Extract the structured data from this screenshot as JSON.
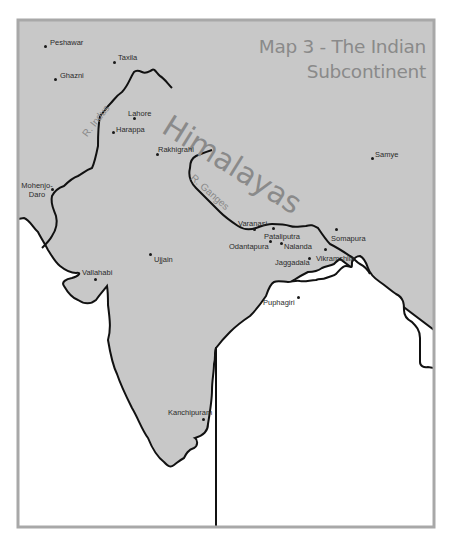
{
  "map": {
    "title_line1": "Map 3 - The Indian",
    "title_line2": "Subcontinent",
    "colors": {
      "land": "#c8c8c8",
      "sea": "#ffffff",
      "frame": "#a8a8a8",
      "coast": "#111111",
      "label": "#8a8a8a"
    },
    "mountain_range": {
      "label": "Himalayas"
    },
    "rivers": [
      {
        "label": "R. Indus"
      },
      {
        "label": "R. Ganges"
      }
    ],
    "cities": [
      {
        "name": "Peshawar",
        "x": 46,
        "y": 46
      },
      {
        "name": "Taxila",
        "x": 114,
        "y": 62
      },
      {
        "name": "Ghazni",
        "x": 55,
        "y": 79
      },
      {
        "name": "Lahore",
        "x": 134,
        "y": 118
      },
      {
        "name": "Harappa",
        "x": 113,
        "y": 132
      },
      {
        "name": "Rakhigrahi",
        "x": 157,
        "y": 154
      },
      {
        "name": "Samye",
        "x": 372,
        "y": 158
      },
      {
        "name": "Mohenjo-Daro",
        "x": 52,
        "y": 189
      },
      {
        "name": "Varanasi",
        "x": 254,
        "y": 229
      },
      {
        "name": "Pataliputra",
        "x": 273,
        "y": 228
      },
      {
        "name": "Somapura",
        "x": 336,
        "y": 229
      },
      {
        "name": "Odantapura",
        "x": 270,
        "y": 241
      },
      {
        "name": "Nalanda",
        "x": 281,
        "y": 243
      },
      {
        "name": "Vikramshila",
        "x": 325,
        "y": 249
      },
      {
        "name": "Jaggadala",
        "x": 309,
        "y": 258
      },
      {
        "name": "Ujjain",
        "x": 150,
        "y": 254
      },
      {
        "name": "Vallahabi",
        "x": 95,
        "y": 279
      },
      {
        "name": "Puphagiri",
        "x": 298,
        "y": 297
      },
      {
        "name": "Kanchipuram",
        "x": 203,
        "y": 419
      }
    ]
  }
}
